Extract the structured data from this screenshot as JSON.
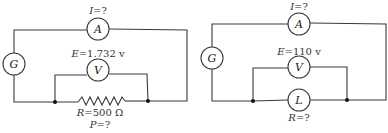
{
  "circuits": [
    {
      "id": "left",
      "ammeter": {
        "symbol": "A",
        "label_var": "I",
        "label_val": "=?"
      },
      "generator": {
        "symbol": "G"
      },
      "voltmeter": {
        "symbol": "V",
        "label_var": "E",
        "label_val": "=1.732 v"
      },
      "load": {
        "type": "resistor",
        "label_var": "R",
        "label_val": "=500 Ω"
      },
      "extra_label": {
        "var": "P",
        "val": "=?"
      }
    },
    {
      "id": "right",
      "ammeter": {
        "symbol": "A",
        "label_var": "I",
        "label_val": "=?"
      },
      "generator": {
        "symbol": "G"
      },
      "voltmeter": {
        "symbol": "V",
        "label_var": "E",
        "label_val": "=110 v"
      },
      "load": {
        "type": "lamp",
        "symbol": "L",
        "label_var": "R",
        "label_val": "=?"
      }
    }
  ],
  "colors": {
    "line": "#3a3a3a",
    "text": "#222222",
    "background": "#ffffff"
  }
}
